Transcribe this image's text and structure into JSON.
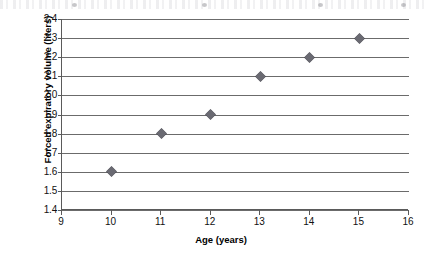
{
  "figure": {
    "scan_artifact_label": "cut-off-scanned-text-line"
  },
  "chart_data": {
    "type": "scatter",
    "title": "",
    "subtitle": "",
    "xlabel": "Age (years)",
    "ylabel": "Forced expiratory volume (liters)",
    "x": [
      10,
      11,
      12,
      13,
      14,
      15
    ],
    "values": [
      1.6,
      1.8,
      1.9,
      2.1,
      2.2,
      2.3
    ],
    "series": [
      {
        "name": "",
        "points": [
          {
            "x": 10,
            "y": 1.6
          },
          {
            "x": 11,
            "y": 1.8
          },
          {
            "x": 12,
            "y": 1.9
          },
          {
            "x": 13,
            "y": 2.1
          },
          {
            "x": 14,
            "y": 2.2
          },
          {
            "x": 15,
            "y": 2.3
          }
        ]
      }
    ],
    "xlim": [
      9,
      16
    ],
    "ylim": [
      1.4,
      2.4
    ],
    "xticks": [
      9,
      10,
      11,
      12,
      13,
      14,
      15,
      16
    ],
    "yticks": [
      1.4,
      1.5,
      1.6,
      1.7,
      1.8,
      1.9,
      2.0,
      2.1,
      2.2,
      2.3,
      2.4
    ],
    "xtick_labels": [
      "9",
      "10",
      "11",
      "12",
      "13",
      "14",
      "15",
      "16"
    ],
    "ytick_labels": [
      "1.4",
      "1.5",
      "1.6",
      "1.7",
      "1.8",
      "1.9",
      "2.0",
      "2.1",
      "2.2",
      "2.3",
      "2.4"
    ],
    "grid": {
      "horizontal": true,
      "vertical": false
    },
    "legend": {
      "visible": false,
      "entries": []
    },
    "marker": {
      "shape": "diamond",
      "color": "#6a6a72",
      "size": 7
    },
    "colors": {
      "axis": "#5a5a5a",
      "gridline": "#6b6b6b",
      "text": "#111111",
      "background": "#ffffff",
      "marker": "#6a6a72"
    }
  }
}
